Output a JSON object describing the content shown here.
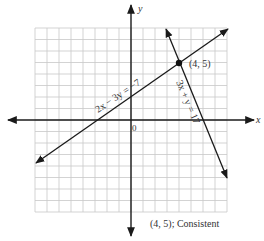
{
  "chart_data": {
    "type": "line",
    "title": "",
    "xlabel": "x",
    "ylabel": "y",
    "xlim": [
      -8,
      8
    ],
    "ylim": [
      -8,
      8
    ],
    "grid": true,
    "origin_label": "0",
    "series": [
      {
        "name": "2x − 3y = −7",
        "equation": "2x - 3y = -7",
        "x": [
          -8,
          8
        ],
        "y": [
          -3,
          7.67
        ]
      },
      {
        "name": "3x + y = 17",
        "equation": "3x + y = 17",
        "x": [
          3,
          8
        ],
        "y": [
          8,
          -7
        ]
      }
    ],
    "annotations": [
      {
        "text": "(4, 5)",
        "x": 4,
        "y": 5,
        "marker": "point"
      }
    ],
    "caption": "(4, 5); Consistent"
  },
  "labels": {
    "x_axis": "x",
    "y_axis": "y",
    "origin": "0",
    "line1": "2x − 3y = −7",
    "line2": "3x + y = 17",
    "point": "(4, 5)",
    "caption": "(4, 5); Consistent"
  }
}
